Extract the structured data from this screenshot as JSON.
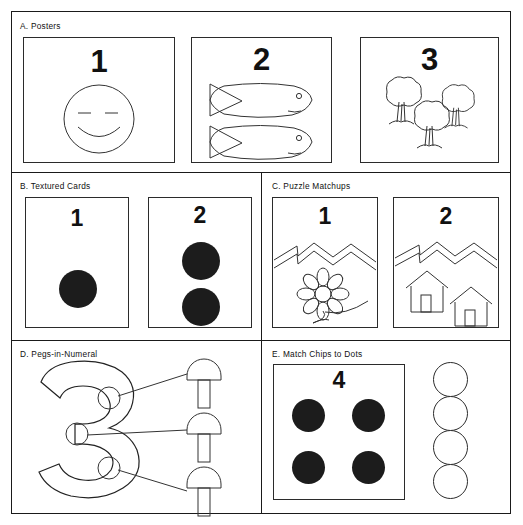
{
  "figure": {
    "background_color": "#ffffff",
    "ink_color": "#222222",
    "dot_fill_color": "#1c1c1c"
  },
  "sections": [
    {
      "id": "a",
      "label": "A. Posters",
      "panels": [
        {
          "numeral": "1",
          "illustration": "smiley-face",
          "count": 1
        },
        {
          "numeral": "2",
          "illustration": "fish",
          "count": 2
        },
        {
          "numeral": "3",
          "illustration": "trees",
          "count": 3
        }
      ]
    },
    {
      "id": "b",
      "label": "B. Textured Cards",
      "panels": [
        {
          "numeral": "1",
          "illustration": "felt-dots",
          "count": 1
        },
        {
          "numeral": "2",
          "illustration": "felt-dots",
          "count": 2
        }
      ]
    },
    {
      "id": "c",
      "label": "C. Puzzle Matchups",
      "panels": [
        {
          "numeral": "1",
          "illustration": "flower",
          "count": 1
        },
        {
          "numeral": "2",
          "illustration": "houses",
          "count": 2
        }
      ]
    },
    {
      "id": "d",
      "label": "D. Pegs-in-Numeral",
      "numeral": "3",
      "peg_holes": 3,
      "pegs": 3,
      "peg_shape": "mushroom"
    },
    {
      "id": "e",
      "label": "E. Match Chips to Dots",
      "numeral": "4",
      "dots": 4,
      "chips": 4,
      "chip_shape": "circle"
    }
  ]
}
